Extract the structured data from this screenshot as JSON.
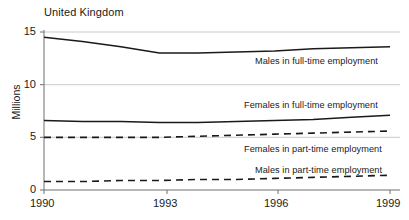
{
  "chart_data": {
    "type": "line",
    "title": "United Kingdom",
    "xlabel": "",
    "ylabel": "Millions",
    "xlim": [
      1990,
      1999
    ],
    "ylim": [
      0,
      15
    ],
    "yticks": [
      0,
      5,
      10,
      15
    ],
    "ytick_labels": [
      "0",
      "5",
      "10",
      "15"
    ],
    "xticks": [
      1990,
      1993,
      1996,
      1999
    ],
    "xtick_labels": [
      "1990",
      "1993",
      "1996",
      "1999"
    ],
    "grid": true,
    "legend_position": "inline-right",
    "x": [
      1990,
      1991,
      1992,
      1993,
      1994,
      1995,
      1996,
      1997,
      1998,
      1999
    ],
    "series": [
      {
        "name": "Males in full-time employment",
        "style": "solid",
        "values": [
          14.5,
          14.1,
          13.6,
          13.0,
          13.0,
          13.1,
          13.2,
          13.4,
          13.5,
          13.6
        ]
      },
      {
        "name": "Females in full-time employment",
        "style": "solid",
        "values": [
          6.6,
          6.5,
          6.5,
          6.4,
          6.4,
          6.5,
          6.6,
          6.7,
          6.9,
          7.1
        ]
      },
      {
        "name": "Females in part-time employment",
        "style": "dashed",
        "values": [
          5.0,
          5.0,
          5.0,
          5.0,
          5.1,
          5.2,
          5.3,
          5.4,
          5.5,
          5.6
        ]
      },
      {
        "name": "Males in part-time employment",
        "style": "dashed",
        "values": [
          0.8,
          0.8,
          0.9,
          0.9,
          1.0,
          1.0,
          1.1,
          1.2,
          1.3,
          1.4
        ]
      }
    ]
  },
  "colors": {
    "line": "#1a1a1a",
    "grid": "#c9c9c9",
    "axis": "#6e6e6e",
    "text": "#1a1a1a",
    "background": "#ffffff"
  },
  "labels": {
    "males_full_time": "Males in full-time employment",
    "females_full_time": "Females in full-time employment",
    "females_part_time": "Females in part-time employment",
    "males_part_time": "Males in part-time employment"
  }
}
